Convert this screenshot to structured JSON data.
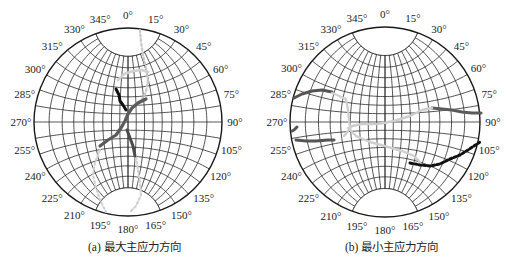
{
  "chart_data": [
    {
      "type": "scatter",
      "subtype": "stereonet-wulff-projection",
      "panel": "a",
      "caption_label": "(a)",
      "caption_text": "最大主应力方向",
      "center": [
        128,
        122
      ],
      "radius": 94,
      "azimuth_ticks": [
        "0°",
        "15°",
        "30°",
        "45°",
        "60°",
        "75°",
        "90°",
        "105°",
        "120°",
        "135°",
        "150°",
        "165°",
        "180°",
        "195°",
        "210°",
        "225°",
        "240°",
        "255°",
        "270°",
        "285°",
        "300°",
        "315°",
        "330°",
        "345°"
      ],
      "grid": {
        "meridian_step_deg": 10,
        "parallel_step_deg": 10,
        "polar_cap_deg": 20
      },
      "series": [
        {
          "name": "light-dotted",
          "color": "#c8c8c8",
          "width": 2.2,
          "dashed": true,
          "points": [
            [
              140,
              30
            ],
            [
              141,
              42
            ],
            [
              143,
              55
            ],
            [
              146,
              68
            ],
            [
              148,
              80
            ],
            [
              146,
              92
            ],
            [
              142,
              99
            ],
            [
              136,
              104
            ],
            [
              131,
              108
            ]
          ]
        },
        {
          "name": "light-arc",
          "color": "#d0d0d0",
          "width": 2.6,
          "dashed": false,
          "points": [
            [
              118,
              80
            ],
            [
              124,
              74
            ],
            [
              133,
              71
            ],
            [
              142,
              70
            ],
            [
              148,
              72
            ]
          ]
        },
        {
          "name": "light-lower-left",
          "color": "#cfcfcf",
          "width": 2.0,
          "dashed": true,
          "points": [
            [
              100,
              150
            ],
            [
              95,
              162
            ],
            [
              93,
              175
            ],
            [
              96,
              188
            ],
            [
              100,
              200
            ],
            [
              106,
              212
            ]
          ]
        },
        {
          "name": "light-lower-right",
          "color": "#d2d2d2",
          "width": 2.2,
          "dashed": true,
          "points": [
            [
              136,
              157
            ],
            [
              138,
              170
            ],
            [
              140,
              183
            ],
            [
              141,
              195
            ],
            [
              136,
              206
            ],
            [
              130,
              212
            ]
          ]
        },
        {
          "name": "black",
          "color": "#111111",
          "width": 3.0,
          "dashed": false,
          "points": [
            [
              116,
              89
            ],
            [
              119,
              95
            ],
            [
              120,
              101
            ],
            [
              123,
              105
            ],
            [
              126,
              110
            ]
          ]
        },
        {
          "name": "dark-gray-main",
          "color": "#5a5a5a",
          "width": 3.2,
          "dashed": false,
          "points": [
            [
              146,
              99
            ],
            [
              138,
              103
            ],
            [
              132,
              108
            ],
            [
              128,
              114
            ],
            [
              125,
              121
            ],
            [
              121,
              128
            ],
            [
              116,
              135
            ],
            [
              108,
              140
            ],
            [
              100,
              146
            ]
          ]
        },
        {
          "name": "dark-gray-lower",
          "color": "#4a4a4a",
          "width": 3.0,
          "dashed": false,
          "points": [
            [
              127,
              130
            ],
            [
              130,
              138
            ],
            [
              133,
              146
            ],
            [
              135,
              156
            ]
          ]
        }
      ]
    },
    {
      "type": "scatter",
      "subtype": "stereonet-wulff-projection",
      "panel": "b",
      "caption_label": "(b)",
      "caption_text": "最小主应力方向",
      "center": [
        385,
        122
      ],
      "radius": 95,
      "azimuth_ticks": [
        "0°",
        "15°",
        "30°",
        "45°",
        "60°",
        "75°",
        "90°",
        "105°",
        "120°",
        "135°",
        "150°",
        "165°",
        "180°",
        "195°",
        "210°",
        "225°",
        "240°",
        "255°",
        "270°",
        "285°",
        "300°",
        "315°",
        "330°",
        "345°"
      ],
      "grid": {
        "meridian_step_deg": 10,
        "parallel_step_deg": 10,
        "polar_cap_deg": 20
      },
      "series": [
        {
          "name": "dark-gray-upper-left",
          "color": "#555555",
          "width": 3.0,
          "dashed": false,
          "points": [
            [
              294,
              98
            ],
            [
              302,
              94
            ],
            [
              312,
              91
            ],
            [
              322,
              90
            ],
            [
              332,
              92
            ]
          ]
        },
        {
          "name": "dark-gray-left-stub",
          "color": "#555555",
          "width": 3.0,
          "dashed": false,
          "points": [
            [
              297,
              127
            ],
            [
              294,
              130
            ],
            [
              292,
              131
            ]
          ]
        },
        {
          "name": "dark-gray-lower-left",
          "color": "#555555",
          "width": 3.0,
          "dashed": false,
          "points": [
            [
              296,
              140
            ],
            [
              306,
              141
            ],
            [
              316,
              141
            ],
            [
              328,
              140
            ],
            [
              334,
              140
            ]
          ]
        },
        {
          "name": "dark-gray-right",
          "color": "#5a5a5a",
          "width": 3.0,
          "dashed": false,
          "points": [
            [
              432,
              108
            ],
            [
              442,
              109
            ],
            [
              452,
              110
            ],
            [
              462,
              112
            ],
            [
              472,
              113
            ],
            [
              481,
              113
            ]
          ]
        },
        {
          "name": "light-center",
          "color": "#d0d0d0",
          "width": 2.4,
          "dashed": false,
          "points": [
            [
              332,
              93
            ],
            [
              346,
              99
            ],
            [
              348,
              110
            ],
            [
              349,
              120
            ],
            [
              350,
              128
            ]
          ]
        },
        {
          "name": "light-sweep",
          "color": "#cdcdcd",
          "width": 2.4,
          "dashed": false,
          "points": [
            [
              344,
              136
            ],
            [
              352,
              126
            ],
            [
              362,
              124
            ],
            [
              378,
              124
            ],
            [
              394,
              121
            ],
            [
              410,
              116
            ],
            [
              422,
              110
            ],
            [
              432,
              108
            ]
          ]
        },
        {
          "name": "light-lower",
          "color": "#cfcfcf",
          "width": 2.4,
          "dashed": false,
          "points": [
            [
              348,
              128
            ],
            [
              356,
              136
            ],
            [
              370,
              142
            ],
            [
              388,
              147
            ],
            [
              402,
              151
            ],
            [
              414,
              156
            ],
            [
              420,
              162
            ]
          ]
        },
        {
          "name": "black-dotted",
          "color": "#111111",
          "width": 3.0,
          "dashed": true,
          "points": [
            [
              410,
              163
            ],
            [
              420,
              165
            ],
            [
              430,
              166
            ],
            [
              440,
              164
            ],
            [
              450,
              159
            ],
            [
              460,
              155
            ],
            [
              468,
              150
            ],
            [
              474,
              146
            ],
            [
              480,
              142
            ]
          ]
        }
      ]
    }
  ],
  "figure": {
    "captions": [
      {
        "id": "a",
        "text": "(a)  最大主应力方向"
      },
      {
        "id": "b",
        "text": "(b)  最小主应力方向"
      }
    ]
  },
  "colors": {
    "grid": "#2a2a2a",
    "primitive_circle": "#1a1a1a",
    "black_series": "#111111",
    "dark_series": "#555555",
    "light_series": "#cccccc"
  }
}
